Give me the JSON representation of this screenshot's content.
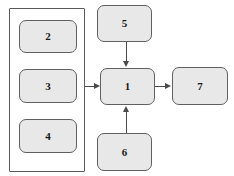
{
  "diagram": {
    "type": "flowchart",
    "background_color": "#ffffff",
    "node_fill_color": "#e8e8e8",
    "node_border_color": "#606060",
    "edge_color": "#4a4a4a",
    "group_border_color": "#5a5a5a",
    "group": {
      "label": "",
      "contains": [
        "2",
        "3",
        "4"
      ]
    },
    "nodes": [
      {
        "id": "n2",
        "label": "2",
        "x": 19,
        "y": 20,
        "w": 58,
        "h": 33
      },
      {
        "id": "n3",
        "label": "3",
        "x": 19,
        "y": 69,
        "w": 58,
        "h": 34
      },
      {
        "id": "n4",
        "label": "4",
        "x": 19,
        "y": 119,
        "w": 58,
        "h": 34
      },
      {
        "id": "n5",
        "label": "5",
        "x": 97,
        "y": 5,
        "w": 55,
        "h": 37
      },
      {
        "id": "n1",
        "label": "1",
        "x": 100,
        "y": 68,
        "w": 55,
        "h": 37
      },
      {
        "id": "n6",
        "label": "6",
        "x": 97,
        "y": 133,
        "w": 55,
        "h": 38
      },
      {
        "id": "n7",
        "label": "7",
        "x": 172,
        "y": 67,
        "w": 56,
        "h": 38
      }
    ],
    "edges": [
      {
        "from": "group",
        "to": "n1",
        "direction": "right"
      },
      {
        "from": "n5",
        "to": "n1",
        "direction": "down"
      },
      {
        "from": "n6",
        "to": "n1",
        "direction": "up"
      },
      {
        "from": "n1",
        "to": "n7",
        "direction": "right"
      }
    ]
  }
}
